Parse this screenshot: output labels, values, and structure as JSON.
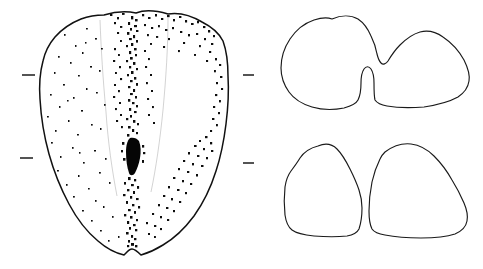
{
  "figure": {
    "description": "Scientific line drawing of a tooth: occlusal view at left with stippled enamel and a dark median fissure, and two cross-section outlines at right.",
    "background_color": "#ffffff",
    "ink_color": "#111111",
    "width": 483,
    "height": 269
  },
  "panels": {
    "occlusal": {
      "name": "occlusal-view",
      "label": "Occlusal view",
      "stipple_color": "#0d0d0d",
      "fissure_label": "median fissure",
      "notch_top_label": "top notch",
      "notch_bottom_label": "basal notch"
    },
    "section_upper": {
      "name": "cross-section-upper",
      "label": "Upper cross-section",
      "lobes": 2,
      "feature": "narrow median slit joining two lobes"
    },
    "section_lower": {
      "name": "cross-section-lower",
      "label": "Lower cross-section",
      "lobes": 2,
      "feature": "two fully separated lobes"
    }
  },
  "scale_marks": {
    "label": "scale reference tick",
    "color": "#2a2a2a",
    "items": [
      {
        "id": "tick-left-upper",
        "x": 22,
        "y": 75,
        "length": 13
      },
      {
        "id": "tick-left-lower",
        "x": 20,
        "y": 158,
        "length": 13
      },
      {
        "id": "tick-right-upper",
        "x": 243,
        "y": 75,
        "length": 11
      },
      {
        "id": "tick-right-lower",
        "x": 243,
        "y": 163,
        "length": 11
      }
    ]
  },
  "chart_data": {
    "type": "scatter",
    "xlabel": "",
    "ylabel": "",
    "xlim": [
      0,
      483
    ],
    "ylim": [
      0,
      269
    ],
    "grid": false,
    "legend": "none",
    "annotations": [
      "occlusal view (left)",
      "upper cross-section (right top)",
      "lower cross-section (right bottom)"
    ]
  }
}
